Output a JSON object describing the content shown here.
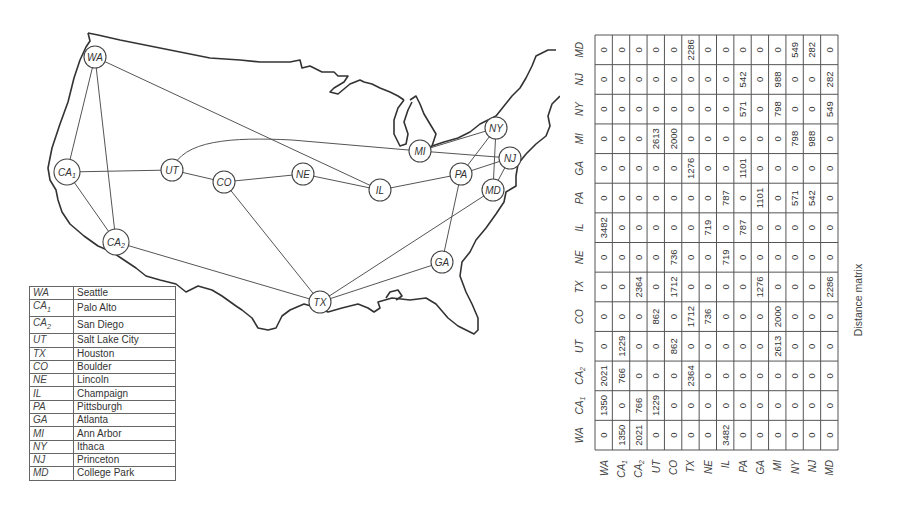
{
  "figure": {
    "caption": "Distance matrix"
  },
  "map": {
    "nodes": [
      {
        "id": "WA",
        "label": "WA",
        "sub": "",
        "x": 95,
        "y": 57
      },
      {
        "id": "CA1",
        "label": "CA",
        "sub": "1",
        "x": 67,
        "y": 172
      },
      {
        "id": "CA2",
        "label": "CA",
        "sub": "2",
        "x": 116,
        "y": 242
      },
      {
        "id": "UT",
        "label": "UT",
        "sub": "",
        "x": 172,
        "y": 170
      },
      {
        "id": "CO",
        "label": "CO",
        "sub": "",
        "x": 224,
        "y": 182
      },
      {
        "id": "NE",
        "label": "NE",
        "sub": "",
        "x": 303,
        "y": 174
      },
      {
        "id": "IL",
        "label": "IL",
        "sub": "",
        "x": 380,
        "y": 190
      },
      {
        "id": "MI",
        "label": "MI",
        "sub": "",
        "x": 420,
        "y": 151
      },
      {
        "id": "NY",
        "label": "NY",
        "sub": "",
        "x": 496,
        "y": 128
      },
      {
        "id": "NJ",
        "label": "NJ",
        "sub": "",
        "x": 510,
        "y": 158
      },
      {
        "id": "PA",
        "label": "PA",
        "sub": "",
        "x": 461,
        "y": 174
      },
      {
        "id": "MD",
        "label": "MD",
        "sub": "",
        "x": 493,
        "y": 190
      },
      {
        "id": "GA",
        "label": "GA",
        "sub": "",
        "x": 442,
        "y": 262
      },
      {
        "id": "TX",
        "label": "TX",
        "sub": "",
        "x": 320,
        "y": 302
      }
    ],
    "edges": [
      [
        "WA",
        "CA1"
      ],
      [
        "WA",
        "CA2"
      ],
      [
        "WA",
        "IL"
      ],
      [
        "CA1",
        "CA2"
      ],
      [
        "CA1",
        "UT"
      ],
      [
        "CA2",
        "TX"
      ],
      [
        "UT",
        "CO"
      ],
      [
        "UT",
        "MI"
      ],
      [
        "CO",
        "NE"
      ],
      [
        "CO",
        "TX"
      ],
      [
        "NE",
        "IL"
      ],
      [
        "IL",
        "PA"
      ],
      [
        "PA",
        "NY"
      ],
      [
        "PA",
        "NJ"
      ],
      [
        "PA",
        "GA"
      ],
      [
        "MI",
        "NY"
      ],
      [
        "MI",
        "NJ"
      ],
      [
        "NY",
        "MD"
      ],
      [
        "NJ",
        "MD"
      ],
      [
        "MD",
        "TX"
      ],
      [
        "GA",
        "TX"
      ]
    ]
  },
  "legend": {
    "rows": [
      {
        "code": "WA",
        "sub": "",
        "city": "Seattle"
      },
      {
        "code": "CA",
        "sub": "1",
        "city": "Palo Alto"
      },
      {
        "code": "CA",
        "sub": "2",
        "city": "San Diego"
      },
      {
        "code": "UT",
        "sub": "",
        "city": "Salt Lake City"
      },
      {
        "code": "TX",
        "sub": "",
        "city": "Houston"
      },
      {
        "code": "CO",
        "sub": "",
        "city": "Boulder"
      },
      {
        "code": "NE",
        "sub": "",
        "city": "Lincoln"
      },
      {
        "code": "IL",
        "sub": "",
        "city": "Champaign"
      },
      {
        "code": "PA",
        "sub": "",
        "city": "Pittsburgh"
      },
      {
        "code": "GA",
        "sub": "",
        "city": "Atlanta"
      },
      {
        "code": "MI",
        "sub": "",
        "city": "Ann Arbor"
      },
      {
        "code": "NY",
        "sub": "",
        "city": "Ithaca"
      },
      {
        "code": "NJ",
        "sub": "",
        "city": "Princeton"
      },
      {
        "code": "MD",
        "sub": "",
        "city": "College Park"
      }
    ]
  },
  "matrix": {
    "labels": [
      {
        "code": "WA",
        "sub": ""
      },
      {
        "code": "CA",
        "sub": "1"
      },
      {
        "code": "CA",
        "sub": "2"
      },
      {
        "code": "UT",
        "sub": ""
      },
      {
        "code": "CO",
        "sub": ""
      },
      {
        "code": "TX",
        "sub": ""
      },
      {
        "code": "NE",
        "sub": ""
      },
      {
        "code": "IL",
        "sub": ""
      },
      {
        "code": "PA",
        "sub": ""
      },
      {
        "code": "GA",
        "sub": ""
      },
      {
        "code": "MI",
        "sub": ""
      },
      {
        "code": "NY",
        "sub": ""
      },
      {
        "code": "NJ",
        "sub": ""
      },
      {
        "code": "MD",
        "sub": ""
      }
    ],
    "values": [
      [
        0,
        1350,
        2021,
        0,
        0,
        0,
        0,
        3482,
        0,
        0,
        0,
        0,
        0,
        0
      ],
      [
        1350,
        0,
        766,
        1229,
        0,
        0,
        0,
        0,
        0,
        0,
        0,
        0,
        0,
        0
      ],
      [
        2021,
        766,
        0,
        0,
        0,
        2364,
        0,
        0,
        0,
        0,
        0,
        0,
        0,
        0
      ],
      [
        0,
        1229,
        0,
        0,
        862,
        0,
        0,
        0,
        0,
        0,
        2613,
        0,
        0,
        0
      ],
      [
        0,
        0,
        0,
        862,
        0,
        1712,
        736,
        0,
        0,
        0,
        2000,
        0,
        0,
        0
      ],
      [
        0,
        0,
        2364,
        0,
        1712,
        0,
        0,
        0,
        0,
        1276,
        0,
        0,
        0,
        2286
      ],
      [
        0,
        0,
        0,
        0,
        736,
        0,
        0,
        719,
        0,
        0,
        0,
        0,
        0,
        0
      ],
      [
        3482,
        0,
        0,
        0,
        0,
        0,
        719,
        0,
        787,
        0,
        0,
        0,
        0,
        0
      ],
      [
        0,
        0,
        0,
        0,
        0,
        0,
        0,
        787,
        0,
        1101,
        0,
        571,
        542,
        0
      ],
      [
        0,
        0,
        0,
        0,
        0,
        1276,
        0,
        0,
        1101,
        0,
        0,
        0,
        0,
        0
      ],
      [
        0,
        0,
        0,
        2613,
        2000,
        0,
        0,
        0,
        0,
        0,
        0,
        798,
        988,
        0
      ],
      [
        0,
        0,
        0,
        0,
        0,
        0,
        0,
        0,
        571,
        0,
        798,
        0,
        0,
        549
      ],
      [
        0,
        0,
        0,
        0,
        0,
        0,
        0,
        0,
        542,
        0,
        988,
        0,
        0,
        282
      ],
      [
        0,
        0,
        0,
        0,
        0,
        2286,
        0,
        0,
        0,
        0,
        0,
        549,
        282,
        0
      ]
    ]
  }
}
